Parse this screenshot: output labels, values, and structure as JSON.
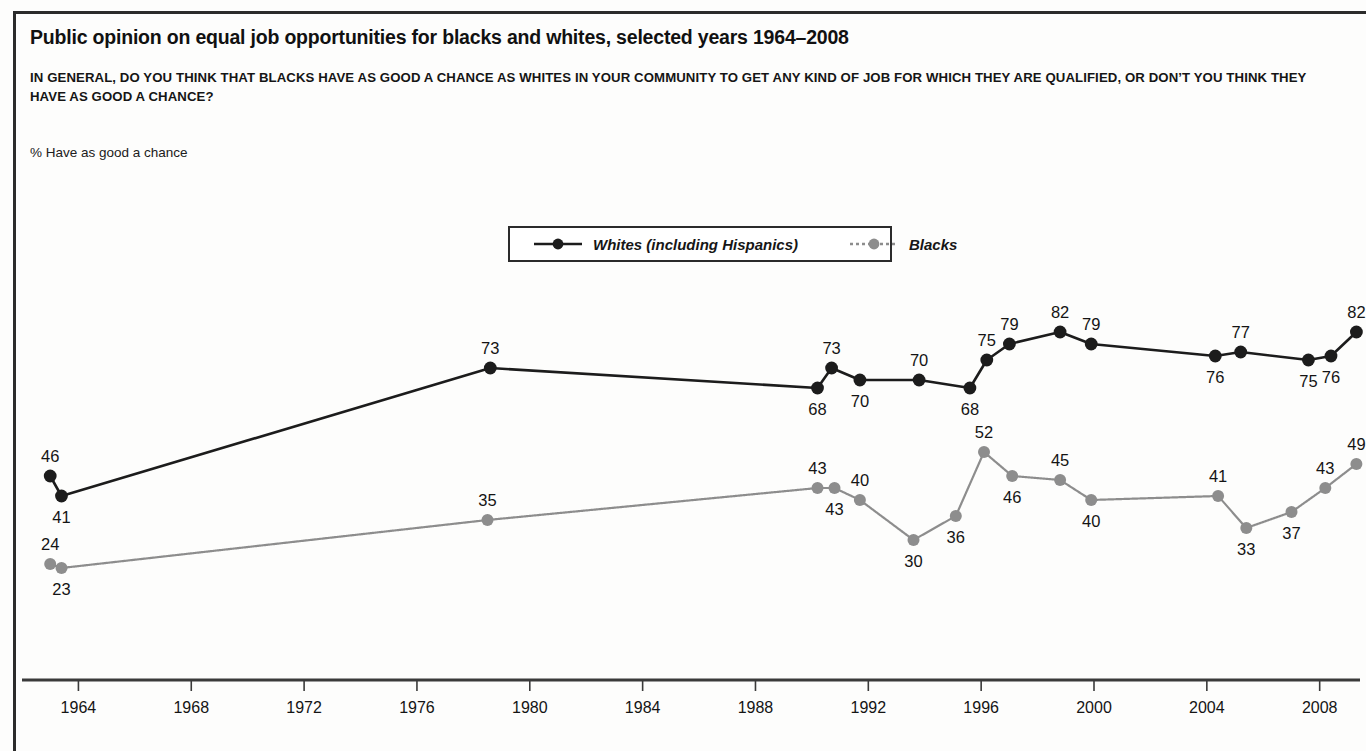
{
  "figure": {
    "title": "Public opinion on equal job opportunities for blacks and whites, selected years 1964–2008",
    "subtitle": "IN GENERAL, DO YOU THINK THAT BLACKS HAVE AS GOOD A CHANCE AS WHITES IN YOUR COMMUNITY TO GET ANY KIND OF JOB FOR WHICH THEY ARE QUALIFIED, OR DON’T YOU THINK THEY HAVE AS GOOD A CHANCE?",
    "y_axis_label": "% Have as good a chance"
  },
  "legend": {
    "position": "top-center",
    "entries": [
      {
        "label": "Whites (including Hispanics)",
        "color": "#1c1c1c",
        "dash": "solid"
      },
      {
        "label": "Blacks",
        "color": "#8d8d8d",
        "dash": "dotted"
      }
    ]
  },
  "colors": {
    "whites": "#1c1c1c",
    "blacks": "#8d8d8d",
    "axis": "#3a3a3a",
    "rule": "#2b2b2b",
    "label": "#141414",
    "background": "#fdfdfc"
  },
  "chart_data": {
    "type": "line",
    "title": "Public opinion on equal job opportunities for blacks and whites, selected years 1964–2008",
    "subtitle": "IN GENERAL, DO YOU THINK THAT BLACKS HAVE AS GOOD A CHANCE AS WHITES IN YOUR COMMUNITY TO GET ANY KIND OF JOB FOR WHICH THEY ARE QUALIFIED, OR DON’T YOU THINK THEY HAVE AS GOOD A CHANCE?",
    "xlabel": "",
    "ylabel": "% Have as good a chance",
    "xlim": [
      1962.0,
      2009.5
    ],
    "ylim": [
      15,
      90
    ],
    "grid": false,
    "x_ticks": [
      1964,
      1968,
      1972,
      1976,
      1980,
      1984,
      1988,
      1992,
      1996,
      2000,
      2004,
      2008
    ],
    "x_tick_labels": [
      "1964",
      "1968",
      "1972",
      "1976",
      "1980",
      "1984",
      "1988",
      "1992",
      "1996",
      "2000",
      "2004",
      "2008"
    ],
    "y_ticks_visible": false,
    "series": [
      {
        "name": "Whites (including Hispanics)",
        "color": "#1c1c1c",
        "dash": "solid",
        "points": [
          {
            "x": 1963.0,
            "y": 46,
            "label": "46",
            "label_pos": "above"
          },
          {
            "x": 1963.4,
            "y": 41,
            "label": "41",
            "label_pos": "below"
          },
          {
            "x": 1978.6,
            "y": 73,
            "label": "73",
            "label_pos": "above"
          },
          {
            "x": 1990.2,
            "y": 68,
            "label": "68",
            "label_pos": "below"
          },
          {
            "x": 1990.7,
            "y": 73,
            "label": "73",
            "label_pos": "above"
          },
          {
            "x": 1991.7,
            "y": 70,
            "label": "70",
            "label_pos": "below"
          },
          {
            "x": 1993.8,
            "y": 70,
            "label": "70",
            "label_pos": "above"
          },
          {
            "x": 1995.6,
            "y": 68,
            "label": "68",
            "label_pos": "below"
          },
          {
            "x": 1996.2,
            "y": 75,
            "label": "75",
            "label_pos": "above"
          },
          {
            "x": 1997.0,
            "y": 79,
            "label": "79",
            "label_pos": "above"
          },
          {
            "x": 1998.8,
            "y": 82,
            "label": "82",
            "label_pos": "above"
          },
          {
            "x": 1999.9,
            "y": 79,
            "label": "79",
            "label_pos": "above"
          },
          {
            "x": 2004.3,
            "y": 76,
            "label": "76",
            "label_pos": "below"
          },
          {
            "x": 2005.2,
            "y": 77,
            "label": "77",
            "label_pos": "above"
          },
          {
            "x": 2007.6,
            "y": 75,
            "label": "75",
            "label_pos": "below"
          },
          {
            "x": 2008.4,
            "y": 76,
            "label": "76",
            "label_pos": "below"
          },
          {
            "x": 2009.3,
            "y": 82,
            "label": "82",
            "label_pos": "above"
          }
        ]
      },
      {
        "name": "Blacks",
        "color": "#8d8d8d",
        "dash": "dotted",
        "points": [
          {
            "x": 1963.0,
            "y": 24,
            "label": "24",
            "label_pos": "above"
          },
          {
            "x": 1963.4,
            "y": 23,
            "label": "23",
            "label_pos": "below"
          },
          {
            "x": 1978.5,
            "y": 35,
            "label": "35",
            "label_pos": "above"
          },
          {
            "x": 1990.2,
            "y": 43,
            "label": "43",
            "label_pos": "above"
          },
          {
            "x": 1990.8,
            "y": 43,
            "label": "43",
            "label_pos": "below"
          },
          {
            "x": 1991.7,
            "y": 40,
            "label": "40",
            "label_pos": "above"
          },
          {
            "x": 1993.6,
            "y": 30,
            "label": "30",
            "label_pos": "below"
          },
          {
            "x": 1995.1,
            "y": 36,
            "label": "36",
            "label_pos": "below"
          },
          {
            "x": 1996.1,
            "y": 52,
            "label": "52",
            "label_pos": "above"
          },
          {
            "x": 1997.1,
            "y": 46,
            "label": "46",
            "label_pos": "below"
          },
          {
            "x": 1998.8,
            "y": 45,
            "label": "45",
            "label_pos": "above"
          },
          {
            "x": 1999.9,
            "y": 40,
            "label": "40",
            "label_pos": "below"
          },
          {
            "x": 2004.4,
            "y": 41,
            "label": "41",
            "label_pos": "above"
          },
          {
            "x": 2005.4,
            "y": 33,
            "label": "33",
            "label_pos": "below"
          },
          {
            "x": 2007.0,
            "y": 37,
            "label": "37",
            "label_pos": "below"
          },
          {
            "x": 2008.2,
            "y": 43,
            "label": "43",
            "label_pos": "above"
          },
          {
            "x": 2009.3,
            "y": 49,
            "label": "49",
            "label_pos": "above"
          }
        ]
      }
    ]
  }
}
